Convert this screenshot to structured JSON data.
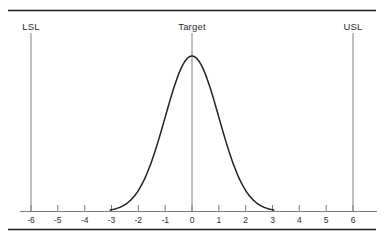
{
  "figure": {
    "title": "",
    "background_color": "#ffffff",
    "border_color": "#1a1a1a",
    "axis_color": "#7d7d7d",
    "curve_color": "#222222",
    "spec_line_color": "#808080",
    "text_color": "#2b2b2b"
  },
  "chart_data": {
    "type": "line",
    "title": "",
    "xlabel": "",
    "ylabel": "",
    "xlim": [
      -6.6,
      6.9
    ],
    "ylim": [
      0,
      1.12
    ],
    "grid": false,
    "legend": null,
    "xticks": [
      -6,
      -5,
      -4,
      -3,
      -2,
      -1,
      0,
      1,
      2,
      3,
      4,
      5,
      6
    ],
    "xtick_labels": [
      "-6",
      "-5",
      "-4",
      "-3",
      "-2",
      "-1",
      "0",
      "1",
      "2",
      "3",
      "4",
      "5",
      "6"
    ],
    "yticks": [],
    "ytick_labels": [],
    "series": [
      {
        "name": "normal-distribution",
        "kind": "line",
        "distribution": "normal",
        "mean": 0,
        "std_dev": 1,
        "peak_value": 1.0,
        "visible_range": [
          -3.05,
          3.05
        ],
        "x": [
          -3.0,
          -2.75,
          -2.5,
          -2.25,
          -2.0,
          -1.75,
          -1.5,
          -1.25,
          -1.0,
          -0.75,
          -0.5,
          -0.25,
          0.0,
          0.25,
          0.5,
          0.75,
          1.0,
          1.25,
          1.5,
          1.75,
          2.0,
          2.25,
          2.5,
          2.75,
          3.0
        ],
        "y": [
          0.011,
          0.023,
          0.044,
          0.079,
          0.135,
          0.216,
          0.325,
          0.458,
          0.607,
          0.755,
          0.882,
          0.969,
          1.0,
          0.969,
          0.882,
          0.755,
          0.607,
          0.458,
          0.325,
          0.216,
          0.135,
          0.079,
          0.044,
          0.023,
          0.011
        ]
      }
    ],
    "annotations": [
      {
        "id": "lsl",
        "label": "LSL",
        "x": -6,
        "type": "vertical-line",
        "description": "Lower Specification Limit"
      },
      {
        "id": "target",
        "label": "Target",
        "x": 0,
        "type": "vertical-line",
        "description": "Process Target"
      },
      {
        "id": "usl",
        "label": "USL",
        "x": 6,
        "type": "vertical-line",
        "description": "Upper Specification Limit"
      }
    ]
  },
  "labels": {
    "lsl": "LSL",
    "target": "Target",
    "usl": "USL"
  },
  "axis": {
    "ticks": [
      "-6",
      "-5",
      "-4",
      "-3",
      "-2",
      "-1",
      "0",
      "1",
      "2",
      "3",
      "4",
      "5",
      "6"
    ]
  }
}
